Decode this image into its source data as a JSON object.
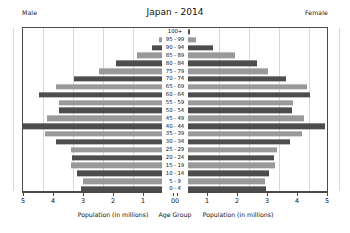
{
  "header": {
    "male_label": "Male",
    "female_label": "Female",
    "title": "Japan - 2014"
  },
  "axis": {
    "left_caption": "Population (in millions)",
    "center_caption": "Age Group",
    "right_caption": "Population (in millions)",
    "left_ticks": [
      "5",
      "4",
      "3",
      "2",
      "1",
      "0"
    ],
    "right_ticks": [
      "0",
      "1",
      "2",
      "3",
      "4",
      "5"
    ]
  },
  "colors": {
    "bar_dark": "#4d4d4d",
    "bar_light": "#999999",
    "frame": "#4a4a4a",
    "grid": "#d8d8d8",
    "background": "#ffffff",
    "text": "#111111"
  },
  "chart_data": {
    "type": "bar",
    "subtype": "population-pyramid",
    "title": "Japan - 2014",
    "xlabel": "Population (in millions)",
    "ylabel": "Age Group",
    "xlim": [
      0,
      5
    ],
    "grid": true,
    "legend_position": "top-corners",
    "categories": [
      "100+",
      "95 - 99",
      "90 - 94",
      "85 - 89",
      "80 - 84",
      "75 - 79",
      "70 - 74",
      "65 - 69",
      "60 - 64",
      "55 - 59",
      "50 - 54",
      "45 - 49",
      "40 - 44",
      "35 - 39",
      "30 - 34",
      "25 - 29",
      "20 - 24",
      "15 - 19",
      "10 - 14",
      "5 - 9",
      "0 - 4"
    ],
    "series": [
      {
        "name": "Male",
        "side": "left",
        "values": [
          0.01,
          0.09,
          0.35,
          0.82,
          1.55,
          2.1,
          2.95,
          3.55,
          4.1,
          3.45,
          3.45,
          3.85,
          4.65,
          3.9,
          3.55,
          3.05,
          3.0,
          3.05,
          2.85,
          2.65,
          2.7
        ]
      },
      {
        "name": "Female",
        "side": "right",
        "values": [
          0.06,
          0.28,
          0.82,
          1.55,
          2.3,
          2.65,
          3.25,
          3.95,
          4.05,
          3.5,
          3.45,
          3.85,
          4.55,
          3.8,
          3.4,
          2.95,
          2.85,
          2.9,
          2.7,
          2.55,
          2.6
        ]
      }
    ],
    "bar_shades": [
      "dark",
      "light",
      "dark",
      "light",
      "dark",
      "light",
      "dark",
      "light",
      "dark",
      "light",
      "dark",
      "light",
      "dark",
      "light",
      "dark",
      "light",
      "dark",
      "light",
      "dark",
      "light",
      "dark"
    ]
  }
}
